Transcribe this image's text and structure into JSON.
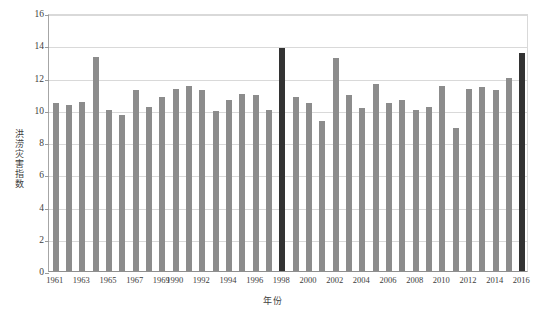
{
  "chart_data": {
    "type": "bar",
    "title": "",
    "xlabel": "年份",
    "ylabel": "洪涝灾害指数",
    "ylim": [
      0,
      16
    ],
    "ytick_step": 2,
    "yticks": [
      "0",
      "2",
      "4",
      "6",
      "8",
      "10",
      "12",
      "14",
      "16"
    ],
    "grid": true,
    "legend": "none",
    "xtick_labels": [
      "1961",
      "1963",
      "1965",
      "1967",
      "1969",
      "1990",
      "1992",
      "1994",
      "1996",
      "1998",
      "2000",
      "2002",
      "2004",
      "2006",
      "2008",
      "2010",
      "2012",
      "2014",
      "2016"
    ],
    "categories": [
      "1961",
      "1962",
      "1963",
      "1964",
      "1965",
      "1966",
      "1967",
      "1968",
      "1969",
      "1990",
      "1991",
      "1992",
      "1993",
      "1994",
      "1995",
      "1996",
      "1997",
      "1998",
      "1999",
      "2000",
      "2001",
      "2002",
      "2003",
      "2004",
      "2005",
      "2006",
      "2007",
      "2008",
      "2009",
      "2010",
      "2011",
      "2012",
      "2013",
      "2014",
      "2015",
      "2016"
    ],
    "values": [
      10.4,
      10.3,
      10.5,
      13.3,
      10.0,
      9.7,
      11.2,
      10.2,
      10.8,
      11.3,
      11.5,
      11.2,
      9.9,
      10.6,
      11.0,
      10.9,
      10.0,
      13.8,
      10.8,
      10.4,
      9.3,
      13.2,
      10.9,
      10.1,
      11.6,
      10.4,
      10.6,
      10.0,
      10.2,
      11.5,
      8.9,
      11.3,
      11.4,
      11.2,
      12.0,
      13.5
    ],
    "highlight_indices": [
      17,
      35
    ],
    "colors": {
      "bar": "#8c8c8c",
      "bar_highlight": "#333333",
      "grid": "#d9d9d9",
      "axis": "#8f8f8f",
      "text": "#3d3d3d"
    }
  }
}
